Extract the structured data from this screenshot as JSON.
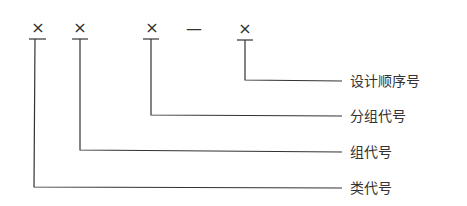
{
  "diagram": {
    "code_symbols": [
      "×",
      "×",
      "×",
      "×"
    ],
    "separator": "—",
    "labels": {
      "design_sequence": "设计顺序号",
      "subgroup_code": "分组代号",
      "group_code": "组代号",
      "class_code": "类代号"
    },
    "line_color": "#333333"
  }
}
